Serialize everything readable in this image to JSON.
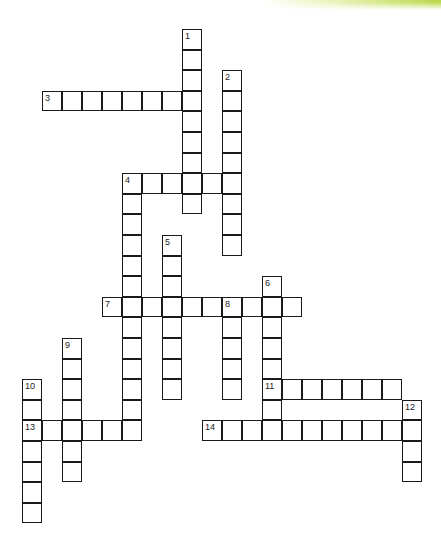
{
  "puzzle": {
    "type": "crossword",
    "accent_color": "#b9d84a",
    "grid_origin": {
      "x": 22,
      "y": 29,
      "col_pitch": 20.0,
      "row_pitch": 20.6
    },
    "entries": [
      {
        "number": "1",
        "direction": "down",
        "col": 8,
        "row": 0,
        "length": 9
      },
      {
        "number": "2",
        "direction": "down",
        "col": 10,
        "row": 2,
        "length": 9
      },
      {
        "number": "3",
        "direction": "across",
        "col": 1,
        "row": 3,
        "length": 8
      },
      {
        "number": "4",
        "direction": "across",
        "col": 5,
        "row": 7,
        "length": 6
      },
      {
        "number": "4",
        "direction": "down",
        "col": 5,
        "row": 7,
        "length": 13
      },
      {
        "number": "5",
        "direction": "down",
        "col": 7,
        "row": 10,
        "length": 8
      },
      {
        "number": "6",
        "direction": "down",
        "col": 12,
        "row": 12,
        "length": 8
      },
      {
        "number": "7",
        "direction": "across",
        "col": 4,
        "row": 13,
        "length": 10
      },
      {
        "number": "8",
        "direction": "down",
        "col": 10,
        "row": 13,
        "length": 5
      },
      {
        "number": "9",
        "direction": "down",
        "col": 2,
        "row": 15,
        "length": 7
      },
      {
        "number": "10",
        "direction": "down",
        "col": 0,
        "row": 17,
        "length": 7
      },
      {
        "number": "11",
        "direction": "across",
        "col": 12,
        "row": 17,
        "length": 7
      },
      {
        "number": "12",
        "direction": "down",
        "col": 19,
        "row": 18,
        "length": 4
      },
      {
        "number": "13",
        "direction": "across",
        "col": 0,
        "row": 19,
        "length": 6
      },
      {
        "number": "14",
        "direction": "across",
        "col": 9,
        "row": 19,
        "length": 11
      }
    ]
  }
}
